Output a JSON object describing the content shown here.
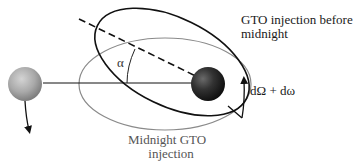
{
  "diagram": {
    "labels": {
      "before_midnight_line1": "GTO injection before",
      "before_midnight_line2": "midnight",
      "midnight_line1": "Midnight GTO",
      "midnight_line2": "injection",
      "angle": "α",
      "rotation": "dΩ + dω"
    },
    "elements": [
      {
        "name": "small-body",
        "shape": "sphere",
        "color": "#a8a8a8"
      },
      {
        "name": "central-body",
        "shape": "sphere",
        "color": "#2a2a2a"
      },
      {
        "name": "midnight-orbit",
        "shape": "ellipse",
        "stroke": "#8a8a8a"
      },
      {
        "name": "before-midnight-orbit",
        "shape": "ellipse",
        "stroke": "#111111"
      },
      {
        "name": "apsidal-line",
        "style": "dashed",
        "stroke": "#111111"
      },
      {
        "name": "reference-line",
        "style": "solid",
        "stroke": "#111111"
      }
    ],
    "colors": {
      "black_orbit": "#111111",
      "gray_orbit": "#8a8a8a",
      "earth": "#2a2a2a",
      "moon": "#a8a8a8"
    }
  }
}
